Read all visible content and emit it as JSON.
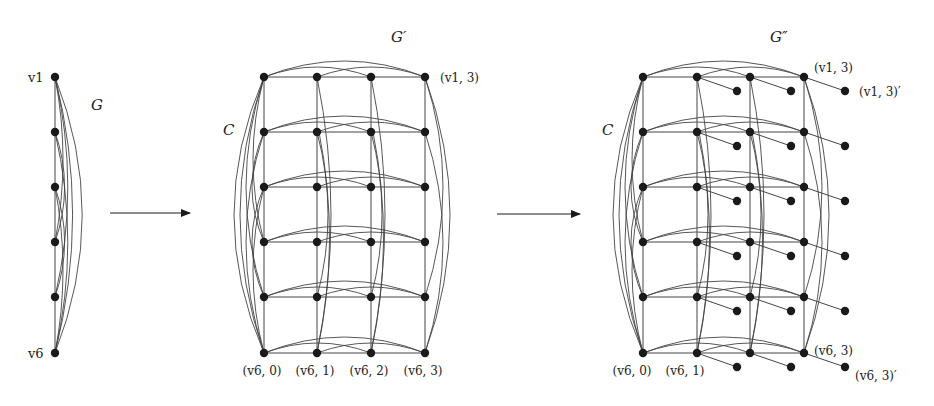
{
  "figure": {
    "graph_G": {
      "title": "G",
      "top_label": "v1",
      "bottom_label": "v6",
      "x": 55,
      "rows_y": [
        77,
        132,
        187,
        242,
        297,
        353
      ]
    },
    "arrow_1": {
      "x1": 110,
      "x2": 190,
      "y": 213
    },
    "graph_G_prime": {
      "title": "G′",
      "cycle_label": "C",
      "cols_x": [
        264,
        317,
        371,
        425
      ],
      "rows_y": [
        77,
        132,
        187,
        242,
        297,
        353
      ],
      "top_right_label": "(v1, 3)",
      "bottom_labels": [
        "(v6, 0)",
        "(v6, 1)",
        "(v6, 2)",
        "(v6, 3)"
      ]
    },
    "arrow_2": {
      "x1": 497,
      "x2": 580,
      "y": 214
    },
    "graph_G_double_prime": {
      "title": "G″",
      "cycle_label": "C",
      "cols_x": [
        643,
        697,
        750,
        804
      ],
      "rows_y": [
        77,
        132,
        187,
        242,
        297,
        353
      ],
      "pendant_x": [
        737,
        791,
        845
      ],
      "pendant_dy": 14,
      "top_right_label": "(v1, 3)",
      "top_pendant_label": "(v1, 3)′",
      "bottom_labels": [
        "(v6, 0)",
        "(v6, 1)"
      ],
      "bottom_right_label": "(v6, 3)",
      "bottom_pendant_label": "(v6, 3)′"
    },
    "colors": {
      "ink": "#1a1a1a",
      "edge": "#444444"
    }
  }
}
